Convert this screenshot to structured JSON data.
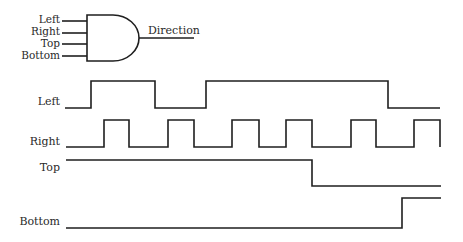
{
  "gate": {
    "type": "AND",
    "inputs": [
      "Left",
      "Right",
      "Top",
      "Bottom"
    ],
    "output": "Direction"
  },
  "timing": {
    "signals": [
      {
        "name": "Left",
        "label": "Left",
        "transitions_x": [
          65,
          91,
          155,
          206,
          388,
          440
        ],
        "levels": [
          "low",
          "high",
          "low",
          "high",
          "low"
        ]
      },
      {
        "name": "Right",
        "label": "Right",
        "transitions_x": [
          66,
          104,
          129,
          168,
          194,
          232,
          259,
          286,
          312,
          351,
          376,
          414,
          440
        ],
        "levels": [
          "low",
          "high",
          "low",
          "high",
          "low",
          "high",
          "low",
          "high",
          "low",
          "high",
          "low",
          "high"
        ]
      },
      {
        "name": "Top",
        "label": "Top",
        "transitions_x": [
          66,
          312,
          441
        ],
        "levels": [
          "high",
          "low"
        ]
      },
      {
        "name": "Bottom",
        "label": "Bottom",
        "transitions_x": [
          66,
          402,
          441
        ],
        "levels": [
          "low",
          "high"
        ]
      }
    ]
  },
  "colors": {
    "line": "#1f1f1f",
    "text": "#2a2a2a",
    "background": "#ffffff"
  }
}
